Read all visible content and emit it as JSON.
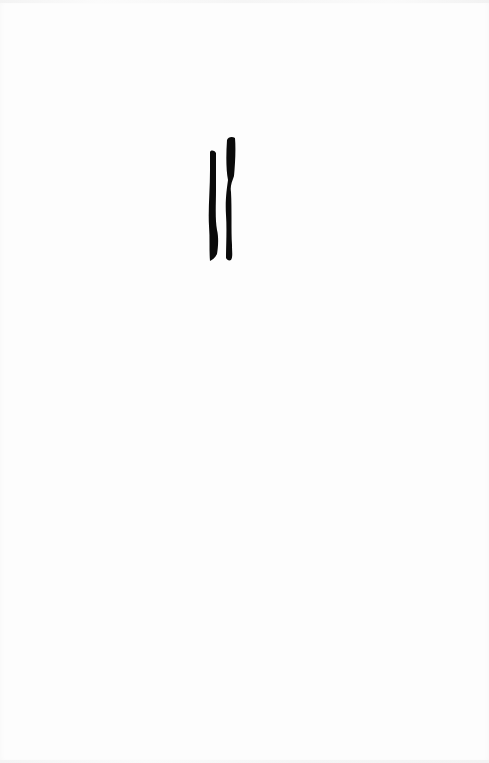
{
  "document": {
    "type": "scanned-page",
    "background_color": "#fdfdfd",
    "ink_color": "#0a0a0a",
    "glyph": {
      "description": "two vertical brush strokes",
      "stroke_count": 2,
      "label": "||"
    }
  }
}
